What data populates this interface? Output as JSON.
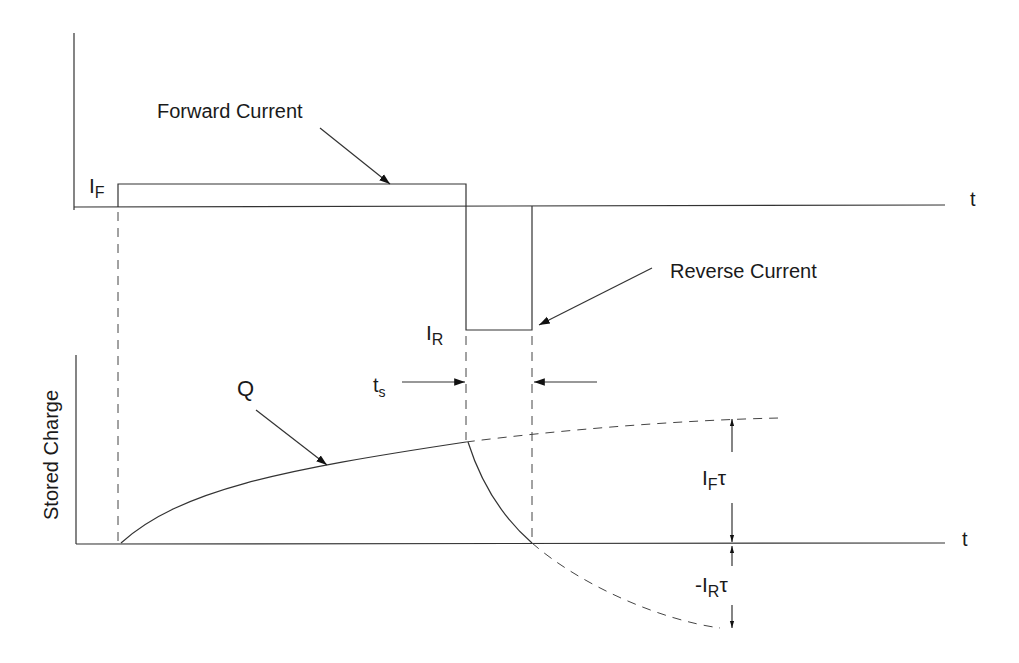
{
  "diagram": {
    "labels": {
      "forward_current": "Forward Current",
      "reverse_current": "Reverse Current",
      "i_f_main": "I",
      "i_f_sub": "F",
      "i_r_main": "I",
      "i_r_sub": "R",
      "t_top": "t",
      "t_bottom": "t",
      "stored_charge": "Stored Charge",
      "q": "Q",
      "ts_main": "t",
      "ts_sub": "s",
      "iftau_main": "I",
      "iftau_sub": "F",
      "iftau_tau": "τ",
      "irtau_neg": "-I",
      "irtau_sub": "R",
      "irtau_tau": "τ"
    }
  }
}
